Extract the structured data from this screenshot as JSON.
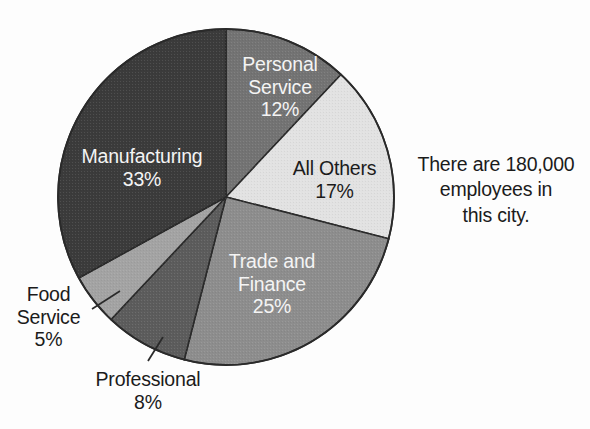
{
  "chart_data": {
    "type": "pie",
    "title": "",
    "subtitle": "",
    "xlabel": "",
    "ylabel": "",
    "legend_position": "none",
    "grid": false,
    "total_label": "There are 180,000 employees in this city.",
    "units": "percent",
    "start_angle_deg": 0,
    "direction": "clockwise",
    "categories": [
      "Personal Service",
      "All Others",
      "Trade and Finance",
      "Professional",
      "Food Service",
      "Manufacturing"
    ],
    "values": [
      12,
      17,
      25,
      8,
      5,
      33
    ],
    "slices": [
      {
        "name": "Personal Service",
        "label_line1": "Personal",
        "label_line2": "Service",
        "value": 12,
        "percent_label": "12%",
        "color": "#737373",
        "text_color": "#f4f4f4",
        "label_placement": "inside"
      },
      {
        "name": "All Others",
        "label_line1": "All Others",
        "label_line2": "",
        "value": 17,
        "percent_label": "17%",
        "color": "#e2e2e2",
        "text_color": "#1b1b1b",
        "label_placement": "inside"
      },
      {
        "name": "Trade and Finance",
        "label_line1": "Trade and",
        "label_line2": "Finance",
        "value": 25,
        "percent_label": "25%",
        "color": "#8d8d8d",
        "text_color": "#f4f4f4",
        "label_placement": "inside"
      },
      {
        "name": "Professional",
        "label_line1": "Professional",
        "label_line2": "",
        "value": 8,
        "percent_label": "8%",
        "color": "#5c5c5c",
        "text_color": "#1b1b1b",
        "label_placement": "outside-leader"
      },
      {
        "name": "Food Service",
        "label_line1": "Food",
        "label_line2": "Service",
        "value": 5,
        "percent_label": "5%",
        "color": "#a3a3a3",
        "text_color": "#1b1b1b",
        "label_placement": "outside-leader"
      },
      {
        "name": "Manufacturing",
        "label_line1": "Manufacturing",
        "label_line2": "",
        "value": 33,
        "percent_label": "33%",
        "color": "#3b3b3b",
        "text_color": "#f4f4f4",
        "label_placement": "inside"
      }
    ]
  },
  "note": {
    "line1": "There are 180,000",
    "line2": "employees in",
    "line3": "this city."
  },
  "colors": {
    "background": "#fdfdfd",
    "outline": "#2a2a2a",
    "leader_line": "#2a2a2a",
    "text_dark": "#1b1b1b",
    "text_light": "#f4f4f4"
  }
}
